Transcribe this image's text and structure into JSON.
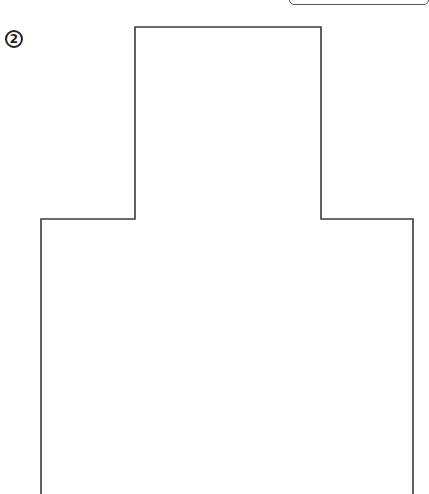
{
  "diagram": {
    "step_badge": {
      "label": "2",
      "shape": "circle"
    },
    "outline": {
      "shape": "stepped-cross-section",
      "stroke_color": "#3a3a3a",
      "points": [
        [
          41,
          494
        ],
        [
          41,
          219
        ],
        [
          135,
          219
        ],
        [
          135,
          27
        ],
        [
          321,
          27
        ],
        [
          321,
          219
        ],
        [
          413,
          219
        ],
        [
          413,
          494
        ]
      ]
    },
    "top_right_box": {
      "shape": "rounded-rectangle",
      "stroke_color": "#555555"
    }
  }
}
